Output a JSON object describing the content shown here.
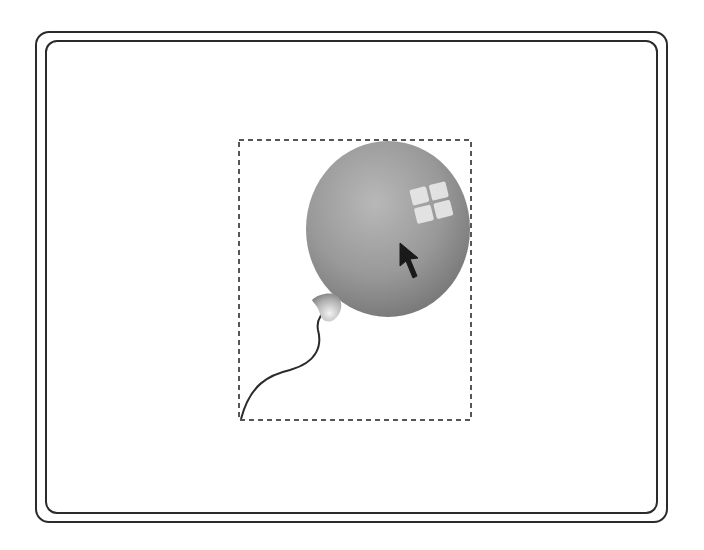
{
  "scene": {
    "description": "Balloon clip-art selected with dashed bounding box inside a double rounded frame",
    "colors": {
      "frame": "#2b2b2b",
      "selection_dash": "#555555",
      "balloon_light": "#b4b4b4",
      "balloon_mid": "#8f8f8f",
      "balloon_dark": "#6e6e6e",
      "highlight": "#e8e8e8",
      "string": "#2a2a2a",
      "cursor": "#1a1a1a"
    },
    "selection_box": {
      "x": 239,
      "y": 140,
      "width": 232,
      "height": 280
    },
    "balloon": {
      "cx": 388,
      "cy": 229,
      "rx": 82,
      "ry": 88
    },
    "icons": {
      "cursor": "arrow-pointer-icon",
      "balloon": "balloon-icon"
    }
  }
}
